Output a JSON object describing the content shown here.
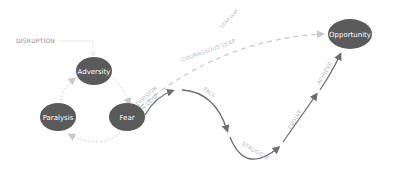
{
  "diagram": {
    "colors": {
      "node_fill": "#5a5a5a",
      "solid_path": "#6e6e6e",
      "dashed_path": "#c9c9c9",
      "label": "#b8b8b8"
    },
    "disruption_label": "DISRUPTION",
    "nodes": {
      "adversity": "Adversity",
      "paralysis": "Paralysis",
      "fear": "Fear",
      "opportunity": "Opportunity"
    },
    "path_labels": {
      "courageous_leap": "COURAGEOUS LEAP",
      "leap_gap": "LEAP GAP",
      "decision_line1": "DIVISION",
      "decision_line2": "& LEAP",
      "fall": "FALL",
      "struggle": "STRUGGLE",
      "evolve": "EVOLVE",
      "achieve": "ACHIEVE"
    }
  }
}
